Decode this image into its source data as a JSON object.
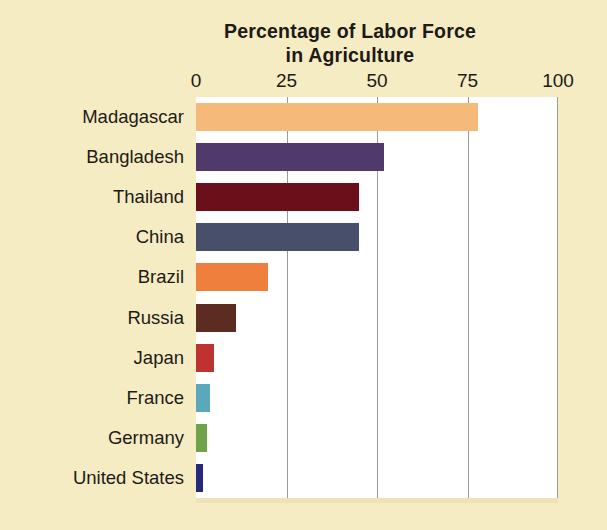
{
  "chart_data": {
    "type": "bar",
    "orientation": "horizontal",
    "title": "Percentage of Labor Force in Agriculture",
    "title_lines": [
      "Percentage of Labor Force",
      "in Agriculture"
    ],
    "categories": [
      "Madagascar",
      "Bangladesh",
      "Thailand",
      "China",
      "Brazil",
      "Russia",
      "Japan",
      "France",
      "Germany",
      "United States"
    ],
    "values": [
      78,
      52,
      45,
      45,
      20,
      11,
      5,
      4,
      3,
      2
    ],
    "xlabel": "",
    "ylabel": "",
    "xlim": [
      0,
      100
    ],
    "xticks": [
      0,
      25,
      50,
      75,
      100
    ],
    "xtick_labels": [
      "0",
      "25",
      "50",
      "75",
      "100"
    ],
    "grid": "vertical",
    "legend": "none",
    "bar_colors": [
      "#f5b97a",
      "#4f3a6b",
      "#6b0f1a",
      "#474f6b",
      "#ee7f3c",
      "#5c2b22",
      "#be3232",
      "#5ba8bd",
      "#6fa34a",
      "#232a7a"
    ],
    "plot_background": "#ffffff",
    "page_background": "#f5ecc3",
    "gridline_color": "#9a9a9a",
    "text_color": "#1d1a16"
  }
}
